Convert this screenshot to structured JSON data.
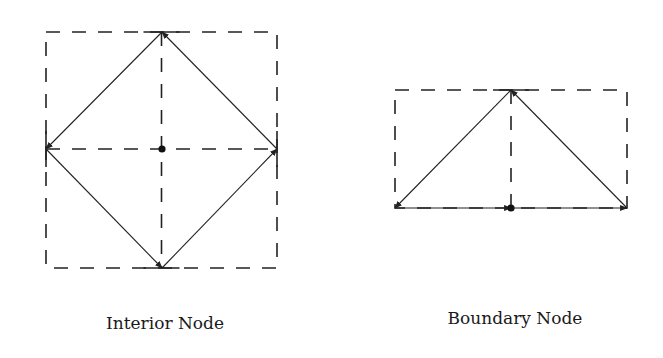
{
  "figure": {
    "panels": [
      {
        "id": "interior",
        "label": "Interior Node",
        "box": {
          "x1": 46,
          "y1": 32,
          "x2": 277,
          "y2": 268
        },
        "center_node": {
          "x": 162,
          "y": 149
        },
        "edges": [
          {
            "from": [
              277,
              149
            ],
            "to": [
              162,
              32
            ]
          },
          {
            "from": [
              162,
              32
            ],
            "to": [
              46,
              149
            ]
          },
          {
            "from": [
              46,
              149
            ],
            "to": [
              162,
              268
            ]
          },
          {
            "from": [
              162,
              268
            ],
            "to": [
              277,
              149
            ]
          }
        ],
        "label_pos": {
          "x": 165,
          "y": 330
        }
      },
      {
        "id": "boundary",
        "label": "Boundary Node",
        "box": {
          "x1": 395,
          "y1": 90,
          "x2": 627,
          "y2": 208
        },
        "center_node": {
          "x": 511,
          "y": 208
        },
        "edges": [
          {
            "from": [
              395,
              208
            ],
            "to": [
              511,
              208
            ]
          },
          {
            "from": [
              511,
              208
            ],
            "to": [
              627,
              208
            ]
          },
          {
            "from": [
              627,
              208
            ],
            "to": [
              511,
              90
            ]
          },
          {
            "from": [
              511,
              90
            ],
            "to": [
              395,
              208
            ]
          }
        ],
        "label_pos": {
          "x": 515,
          "y": 325
        }
      }
    ],
    "colors": {
      "line": "#222222",
      "dash": "#222222",
      "background": "#ffffff"
    }
  }
}
